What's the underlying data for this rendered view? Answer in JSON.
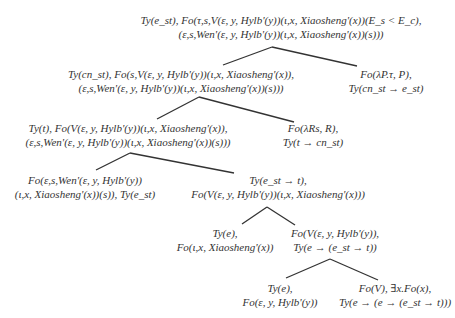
{
  "diagram": {
    "type": "derivation-tree",
    "line_color": "#333333",
    "nodes": [
      {
        "id": "root",
        "lines": [
          "Ty(e_st), Fo(τ,s,V(ε, y, Hylb'(y))(ι,x, Xiaosheng'(x))(E_s < E_c),",
          "(ε,s,Wen'(ε, y, Hylb'(y))(ι,x, Xiaosheng'(x))(s)))"
        ]
      },
      {
        "id": "n1",
        "lines": [
          "Ty(cn_st), Fo(s,V(ε, y, Hylb'(y))(ι,x, Xiaosheng'(x)),",
          "(ε,s,Wen'(ε, y, Hylb'(y))(ι,x, Xiaosheng'(x))(s)))"
        ]
      },
      {
        "id": "n2",
        "lines": [
          "Fo(λP.τ, P),",
          "Ty(cn_st → e_st)"
        ]
      },
      {
        "id": "n3",
        "lines": [
          "Ty(t), Fo(V(ε, y, Hylb'(y))(ι,x, Xiaosheng'(x)),",
          "(ε,s,Wen'(ε, y, Hylb'(y))(ι,x, Xiaosheng'(x))(s)))"
        ]
      },
      {
        "id": "n4",
        "lines": [
          "Fo(λRs, R),",
          "Ty(t → cn_st)"
        ]
      },
      {
        "id": "n5",
        "lines": [
          "Fo(ε,s,Wen'(ε, y, Hylb'(y))",
          "(ι,x, Xiaosheng'(x))(s)), Ty(e_st)"
        ]
      },
      {
        "id": "n6",
        "lines": [
          "Ty(e_st → t),",
          "Fo(V(ε, y, Hylb'(y))(ι,x, Xiaosheng'(x)))"
        ]
      },
      {
        "id": "n7",
        "lines": [
          "Ty(e),",
          "Fo(ι,x, Xiaosheng'(x))"
        ]
      },
      {
        "id": "n8",
        "lines": [
          "Fo(V(ε, y, Hylb'(y)),",
          "Ty(e → (e_st → t))"
        ]
      },
      {
        "id": "n9",
        "lines": [
          "Ty(e),",
          "Fo(ε, y, Hylb'(y))"
        ]
      },
      {
        "id": "n10",
        "lines": [
          "Fo(V), ∃x.Fo(x),",
          "Ty(e → (e → (e_st → t)))"
        ]
      }
    ],
    "edges": [
      [
        "root",
        "n1"
      ],
      [
        "root",
        "n2"
      ],
      [
        "n1",
        "n3"
      ],
      [
        "n1",
        "n4"
      ],
      [
        "n3",
        "n5"
      ],
      [
        "n3",
        "n6"
      ],
      [
        "n6",
        "n7"
      ],
      [
        "n6",
        "n8"
      ],
      [
        "n8",
        "n9"
      ],
      [
        "n8",
        "n10"
      ]
    ]
  }
}
